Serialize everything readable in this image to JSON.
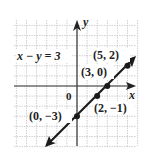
{
  "chart_data": {
    "type": "line",
    "title": "",
    "equation": "x − y = 3",
    "xlabel": "x",
    "ylabel": "y",
    "origin_label": "0",
    "xlim": [
      -6,
      6
    ],
    "ylim": [
      -6,
      6
    ],
    "grid": true,
    "series": [
      {
        "name": "x − y = 3",
        "x": [
          0,
          2,
          3,
          5
        ],
        "y": [
          -3,
          -1,
          0,
          2
        ]
      }
    ],
    "points": [
      {
        "label": "(5, 2)",
        "x": 5,
        "y": 2
      },
      {
        "label": "(3, 0)",
        "x": 3,
        "y": 0
      },
      {
        "label": "(2, −1)",
        "x": 2,
        "y": -1
      },
      {
        "label": "(0, −3)",
        "x": 0,
        "y": -3
      }
    ]
  },
  "colors": {
    "line": "#1a1a1a",
    "grid": "#bdbdbd",
    "axis": "#333333"
  }
}
